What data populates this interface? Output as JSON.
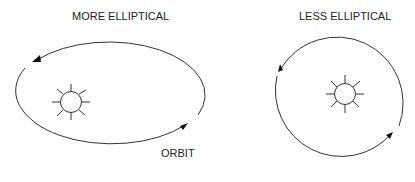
{
  "diagram": {
    "left": {
      "title": "MORE ELLIPTICAL",
      "orbit_label": "ORBIT",
      "shape": "ellipse",
      "sun_icon": "sun-icon"
    },
    "right": {
      "title": "LESS ELLIPTICAL",
      "shape": "circle",
      "sun_icon": "sun-icon"
    },
    "stroke_color": "#333333",
    "background": "#ffffff"
  }
}
